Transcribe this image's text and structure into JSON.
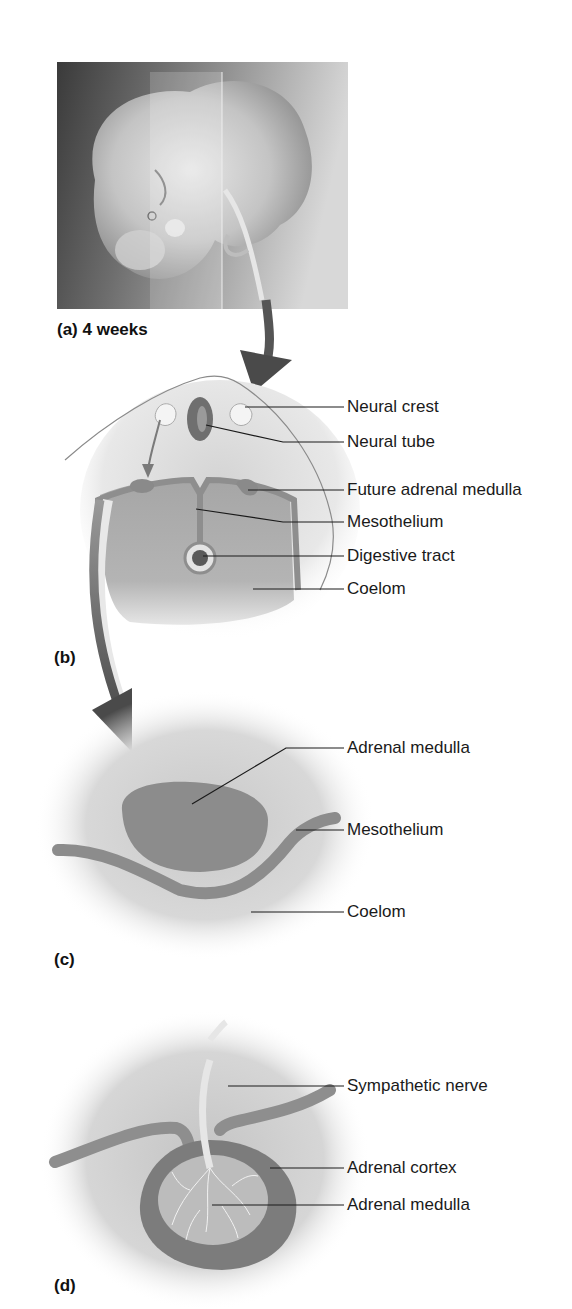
{
  "figure": {
    "panels": [
      {
        "id": "a",
        "label": "(a) 4 weeks",
        "content": "embryo-photo",
        "callouts": []
      },
      {
        "id": "b",
        "label": "(b)",
        "content": "cross-section-embryo",
        "callouts": [
          {
            "text": "Neural crest"
          },
          {
            "text": "Neural tube"
          },
          {
            "text": "Future adrenal medulla"
          },
          {
            "text": "Mesothelium"
          },
          {
            "text": "Digestive tract"
          },
          {
            "text": "Coelom"
          }
        ]
      },
      {
        "id": "c",
        "label": "(c)",
        "content": "adrenal-medulla-migration",
        "callouts": [
          {
            "text": "Adrenal medulla"
          },
          {
            "text": "Mesothelium"
          },
          {
            "text": "Coelom"
          }
        ]
      },
      {
        "id": "d",
        "label": "(d)",
        "content": "adrenal-gland-formed",
        "callouts": [
          {
            "text": "Sympathetic nerve"
          },
          {
            "text": "Adrenal cortex"
          },
          {
            "text": "Adrenal medulla"
          }
        ]
      }
    ],
    "colors": {
      "tissue_dark": "#7a7a7a",
      "tissue_mid": "#9a9a9a",
      "tissue_light": "#c8c8c8",
      "outline": "#8c8c8c",
      "leader_line": "#1a1a1a",
      "arrow": "#5a5a5a",
      "background": "#ffffff"
    }
  }
}
